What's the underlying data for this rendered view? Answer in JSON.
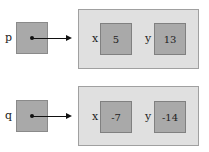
{
  "diagram": {
    "references": [
      {
        "name": "p",
        "object": {
          "fields": [
            {
              "name": "x",
              "value": "5"
            },
            {
              "name": "y",
              "value": "13"
            }
          ]
        }
      },
      {
        "name": "q",
        "object": {
          "fields": [
            {
              "name": "x",
              "value": "-7"
            },
            {
              "name": "y",
              "value": "-14"
            }
          ]
        }
      }
    ],
    "colors": {
      "box_fill": "#a9a9a9",
      "frame_fill": "#e0e0e0",
      "arrow": "#111111"
    }
  }
}
